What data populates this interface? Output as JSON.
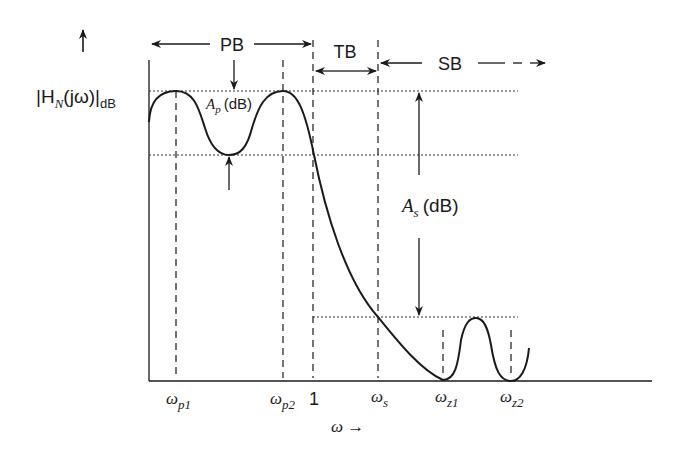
{
  "diagram": {
    "y_axis_label": {
      "main": "|H",
      "sub_N": "N",
      "arg": "(jω)|",
      "unit": "dB"
    },
    "x_axis_label": "ω →",
    "bands": {
      "passband": "PB",
      "transition": "TB",
      "stopband": "SB"
    },
    "annotations": {
      "passband_ripple": {
        "symbol": "A",
        "sub": "p",
        "unit": "(dB)"
      },
      "stopband_attenuation": {
        "symbol": "A",
        "sub": "s",
        "unit": "(dB)"
      }
    },
    "x_ticks": [
      {
        "symbol": "ω",
        "sub": "p1"
      },
      {
        "symbol": "ω",
        "sub": "p2"
      },
      {
        "symbol": "1",
        "sub": ""
      },
      {
        "symbol": "ω",
        "sub": "s"
      },
      {
        "symbol": "ω",
        "sub": "z1"
      },
      {
        "symbol": "ω",
        "sub": "z2"
      }
    ],
    "colors": {
      "line": "#1a1a1a",
      "background": "#ffffff"
    }
  }
}
